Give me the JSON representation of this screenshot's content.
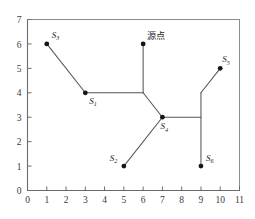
{
  "figure": {
    "name": "steiner-network-plot",
    "background_color": "#ffffff",
    "line_color": "#555555",
    "node_color": "#151515",
    "axis_color": "#6b6b6b"
  },
  "axes": {
    "x_ticks": [
      "0",
      "1",
      "2",
      "3",
      "4",
      "5",
      "6",
      "7",
      "8",
      "9",
      "10",
      "11"
    ],
    "y_ticks": [
      "0",
      "1",
      "2",
      "3",
      "4",
      "5",
      "6",
      "7"
    ],
    "xlim": [
      0,
      11
    ],
    "ylim": [
      0,
      7
    ],
    "xlabel": "",
    "ylabel": ""
  },
  "annotations": {
    "source_label": "源点"
  },
  "nodes": [
    {
      "id": "S1",
      "label": "S",
      "sub": "1",
      "x": 3,
      "y": 4,
      "label_dx": 4,
      "label_dy": 11,
      "type": "terminal"
    },
    {
      "id": "S2",
      "label": "S",
      "sub": "2",
      "x": 5,
      "y": 1,
      "label_dx": -14,
      "label_dy": -5,
      "type": "terminal"
    },
    {
      "id": "S3",
      "label": "S",
      "sub": "3",
      "x": 1,
      "y": 6,
      "label_dx": 5,
      "label_dy": -6,
      "type": "terminal"
    },
    {
      "id": "S4",
      "label": "S",
      "sub": "4",
      "x": 7,
      "y": 3,
      "label_dx": -2,
      "label_dy": 12,
      "type": "junction"
    },
    {
      "id": "S5",
      "label": "S",
      "sub": "5",
      "x": 10,
      "y": 5,
      "label_dx": 2,
      "label_dy": -6,
      "type": "terminal"
    },
    {
      "id": "S6",
      "label": "S",
      "sub": "6",
      "x": 9,
      "y": 1,
      "label_dx": 5,
      "label_dy": -5,
      "type": "terminal"
    },
    {
      "id": "SRC",
      "label": "",
      "sub": "",
      "x": 6,
      "y": 6,
      "label_dx": 4,
      "label_dy": -5,
      "type": "source"
    }
  ],
  "steiner_points": [
    {
      "id": "P1",
      "x": 6,
      "y": 4
    },
    {
      "id": "P2",
      "x": 9,
      "y": 3
    },
    {
      "id": "P3",
      "x": 9,
      "y": 4
    }
  ],
  "edges": [
    {
      "from": "S3",
      "to": "S1",
      "points": [
        [
          1,
          6
        ],
        [
          3,
          4
        ]
      ]
    },
    {
      "from": "S1",
      "to": "P1",
      "points": [
        [
          3,
          4
        ],
        [
          6,
          4
        ]
      ]
    },
    {
      "from": "SRC",
      "to": "P1",
      "points": [
        [
          6,
          6
        ],
        [
          6,
          4
        ]
      ]
    },
    {
      "from": "P1",
      "to": "S4",
      "points": [
        [
          6,
          4
        ],
        [
          7,
          3
        ]
      ]
    },
    {
      "from": "S2",
      "to": "S4",
      "points": [
        [
          5,
          1
        ],
        [
          7,
          3
        ]
      ]
    },
    {
      "from": "S4",
      "to": "P2",
      "points": [
        [
          7,
          3
        ],
        [
          9,
          3
        ]
      ]
    },
    {
      "from": "S6",
      "to": "P3",
      "points": [
        [
          9,
          1
        ],
        [
          9,
          4
        ]
      ]
    },
    {
      "from": "P3",
      "to": "S5",
      "points": [
        [
          9,
          4
        ],
        [
          10,
          5
        ]
      ]
    }
  ],
  "chart_data": {
    "type": "scatter",
    "title": "",
    "xlabel": "",
    "ylabel": "",
    "xlim": [
      0,
      11
    ],
    "ylim": [
      0,
      7
    ],
    "grid": false,
    "legend": null,
    "points": [
      {
        "name": "S3",
        "x": 1,
        "y": 6
      },
      {
        "name": "S1",
        "x": 3,
        "y": 4
      },
      {
        "name": "S2",
        "x": 5,
        "y": 1
      },
      {
        "name": "源点",
        "x": 6,
        "y": 6
      },
      {
        "name": "S4",
        "x": 7,
        "y": 3
      },
      {
        "name": "S6",
        "x": 9,
        "y": 1
      },
      {
        "name": "S5",
        "x": 10,
        "y": 5
      }
    ],
    "network_edges": [
      [
        [
          1,
          6
        ],
        [
          3,
          4
        ]
      ],
      [
        [
          3,
          4
        ],
        [
          6,
          4
        ]
      ],
      [
        [
          6,
          6
        ],
        [
          6,
          4
        ]
      ],
      [
        [
          6,
          4
        ],
        [
          7,
          3
        ]
      ],
      [
        [
          5,
          1
        ],
        [
          7,
          3
        ]
      ],
      [
        [
          7,
          3
        ],
        [
          9,
          3
        ]
      ],
      [
        [
          9,
          1
        ],
        [
          9,
          4
        ]
      ],
      [
        [
          9,
          4
        ],
        [
          10,
          5
        ]
      ]
    ],
    "annotations": [
      "源点"
    ]
  }
}
